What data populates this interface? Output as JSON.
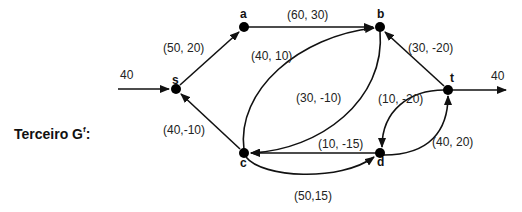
{
  "title": {
    "text": "Terceiro G",
    "superscript": "f",
    "suffix": ":"
  },
  "colors": {
    "edge": "#111111",
    "node": "#000000",
    "text": "#222222",
    "background": "#ffffff"
  },
  "nodes": [
    {
      "id": "s",
      "label": "s",
      "x": 176,
      "y": 89
    },
    {
      "id": "a",
      "label": "a",
      "x": 244,
      "y": 27
    },
    {
      "id": "b",
      "label": "b",
      "x": 380,
      "y": 27
    },
    {
      "id": "t",
      "label": "t",
      "x": 448,
      "y": 90
    },
    {
      "id": "c",
      "label": "c",
      "x": 244,
      "y": 153
    },
    {
      "id": "d",
      "label": "d",
      "x": 380,
      "y": 153
    }
  ],
  "edges": [
    {
      "from": "source",
      "to": "s",
      "label": "40"
    },
    {
      "from": "s",
      "to": "a",
      "label": "(50, 20)"
    },
    {
      "from": "a",
      "to": "b",
      "label": "(60, 30)"
    },
    {
      "from": "c",
      "to": "b",
      "label": "(40, 10)"
    },
    {
      "from": "b",
      "to": "c",
      "label": "(30, -10)"
    },
    {
      "from": "t",
      "to": "b",
      "label": "(30, -20)"
    },
    {
      "from": "c",
      "to": "s",
      "label": "(40,-10)"
    },
    {
      "from": "d",
      "to": "c",
      "label": "(10, -15)"
    },
    {
      "from": "c",
      "to": "d",
      "label": "(50,15)"
    },
    {
      "from": "t",
      "to": "d",
      "label": "(10, -20)"
    },
    {
      "from": "d",
      "to": "t",
      "label": "(40, 20)"
    },
    {
      "from": "t",
      "to": "sink",
      "label": "40"
    }
  ]
}
